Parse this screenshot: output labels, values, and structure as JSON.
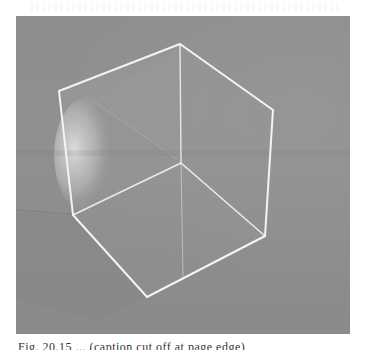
{
  "page": {
    "background": "#ffffff"
  },
  "figure": {
    "photo_tone": "#8c8c8c",
    "edge_color": "#f2f2f2",
    "reflection_color": "#d8d8d8"
  },
  "caption": {
    "text": "Fig. 20.15  ...  (caption cut off at page edge)"
  }
}
